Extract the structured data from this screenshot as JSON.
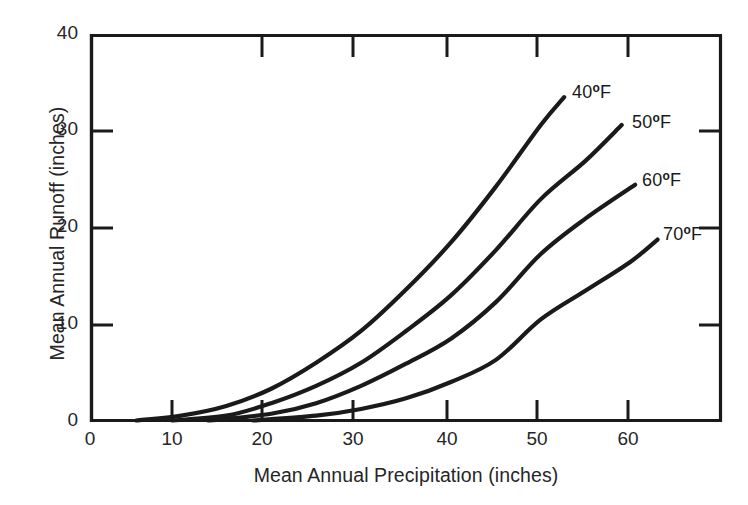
{
  "chart_data": {
    "type": "line",
    "title": "",
    "xlabel": "Mean Annual Precipitation (inches)",
    "ylabel": "Mean Annual Runoff (inches)",
    "xlim": [
      0,
      70
    ],
    "ylim": [
      0,
      40
    ],
    "xticks": [
      0,
      10,
      20,
      30,
      40,
      50,
      60
    ],
    "yticks": [
      0,
      10,
      20,
      30,
      40
    ],
    "xtick_labels": [
      "0",
      "10",
      "20",
      "30",
      "40",
      "50",
      "60"
    ],
    "ytick_labels": [
      "0",
      "10",
      "20",
      "30",
      "40"
    ],
    "grid": false,
    "legend_position": "inline-end-of-line",
    "line_color": "#1a1a1a",
    "axis_color": "#1a1a1a",
    "background_color": "#ffffff",
    "series": [
      {
        "name": "40°F",
        "label_text": "40",
        "label_degree": "o",
        "label_unit": "F",
        "points": [
          [
            5,
            0.0
          ],
          [
            10,
            0.5
          ],
          [
            15,
            1.5
          ],
          [
            20,
            3.3
          ],
          [
            25,
            6.0
          ],
          [
            30,
            9.3
          ],
          [
            35,
            13.6
          ],
          [
            40,
            18.5
          ],
          [
            45,
            24.3
          ],
          [
            50,
            30.7
          ],
          [
            52.6,
            33.6
          ]
        ]
      },
      {
        "name": "50°F",
        "label_text": "50",
        "label_degree": "o",
        "label_unit": "F",
        "points": [
          [
            9,
            0.0
          ],
          [
            15,
            0.5
          ],
          [
            20,
            1.8
          ],
          [
            25,
            3.6
          ],
          [
            30,
            6.0
          ],
          [
            35,
            9.3
          ],
          [
            40,
            13.0
          ],
          [
            45,
            17.7
          ],
          [
            50,
            23.0
          ],
          [
            55,
            27.0
          ],
          [
            59,
            30.7
          ]
        ]
      },
      {
        "name": "60°F",
        "label_text": "60",
        "label_degree": "o",
        "label_unit": "F",
        "points": [
          [
            13,
            0.0
          ],
          [
            20,
            0.7
          ],
          [
            25,
            1.8
          ],
          [
            30,
            3.6
          ],
          [
            35,
            5.9
          ],
          [
            40,
            8.5
          ],
          [
            45,
            12.3
          ],
          [
            50,
            17.3
          ],
          [
            55,
            21.0
          ],
          [
            60.5,
            24.5
          ]
        ]
      },
      {
        "name": "70°F",
        "label_text": "70",
        "label_degree": "o",
        "label_unit": "F",
        "points": [
          [
            18,
            0.0
          ],
          [
            25,
            0.5
          ],
          [
            30,
            1.2
          ],
          [
            35,
            2.3
          ],
          [
            40,
            4.0
          ],
          [
            45,
            6.3
          ],
          [
            50,
            10.5
          ],
          [
            55,
            13.5
          ],
          [
            60,
            16.5
          ],
          [
            63,
            18.8
          ]
        ]
      }
    ]
  },
  "axis": {
    "xtick_0": "0",
    "xtick_10": "10",
    "xtick_20": "20",
    "xtick_30": "30",
    "xtick_40": "40",
    "xtick_50": "50",
    "xtick_60": "60",
    "ytick_0": "0",
    "ytick_10": "10",
    "ytick_20": "20",
    "ytick_30": "30",
    "ytick_40": "40",
    "xlabel": "Mean Annual Precipitation (inches)",
    "ylabel": "Mean Annual Runoff (inches)"
  },
  "labels": {
    "s40_value": "40",
    "s40_deg": "o",
    "s40_unit": "F",
    "s50_value": "50",
    "s50_deg": "o",
    "s50_unit": "F",
    "s60_value": "60",
    "s60_deg": "o",
    "s60_unit": "F",
    "s70_value": "70",
    "s70_deg": "o",
    "s70_unit": "F"
  }
}
